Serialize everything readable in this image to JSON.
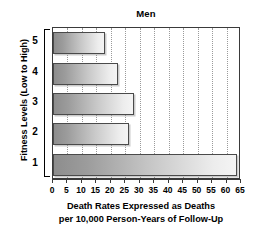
{
  "chart_data": {
    "type": "bar",
    "orientation": "horizontal",
    "title": "Men",
    "xlabel_line1": "Death Rates Expressed as Deaths",
    "xlabel_line2": "per 10,000 Person-Years of Follow-Up",
    "ylabel": "Fitness Levels (Low to High)",
    "categories": [
      "1",
      "2",
      "3",
      "4",
      "5"
    ],
    "values": [
      63.5,
      26.3,
      28.0,
      22.5,
      18.0
    ],
    "bars": [
      {
        "category": "1",
        "value": 63.5
      },
      {
        "category": "2",
        "value": 26.3
      },
      {
        "category": "3",
        "value": 28.0
      },
      {
        "category": "4",
        "value": 22.5
      },
      {
        "category": "5",
        "value": 18.0
      }
    ],
    "xlim": [
      0,
      65
    ],
    "xticks": [
      0,
      5,
      10,
      15,
      20,
      25,
      30,
      35,
      40,
      45,
      50,
      55,
      60,
      65
    ],
    "xtick_labels": [
      "0",
      "5",
      "10",
      "15",
      "20",
      "25",
      "30",
      "35",
      "40",
      "45",
      "50",
      "55",
      "60",
      "65"
    ],
    "grid": true,
    "grid_axis": "x",
    "grid_style": "dotted",
    "legend": null,
    "colors": {
      "bar_fill_dark": "#8d8d8d",
      "bar_fill_light": "#f4f4f4",
      "bar_border": "#4a4a4a",
      "frame": "#3a3a3a",
      "grid": "#9a9a9a",
      "text": "#000000",
      "background": "#ffffff"
    }
  }
}
